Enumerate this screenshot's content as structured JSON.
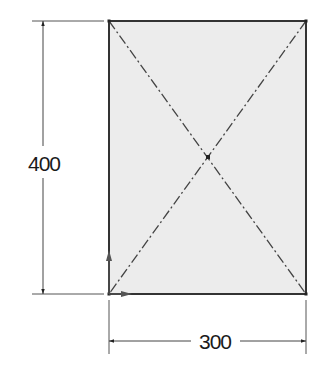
{
  "drawing": {
    "type": "rectangle-sketch",
    "fill_color": "#ececec",
    "outline_color": "#333333",
    "centerline_color": "#444444",
    "rectangle": {
      "x1": 109,
      "y1": 21,
      "x2": 306,
      "y2": 294
    },
    "center": {
      "x": 208,
      "y": 157
    }
  },
  "dimensions": {
    "height": {
      "value": "400",
      "line_x": 43
    },
    "width": {
      "value": "300",
      "line_y": 341
    }
  },
  "origin_axes": {
    "x_arrow": "x-axis-arrow",
    "y_arrow": "y-axis-arrow"
  }
}
